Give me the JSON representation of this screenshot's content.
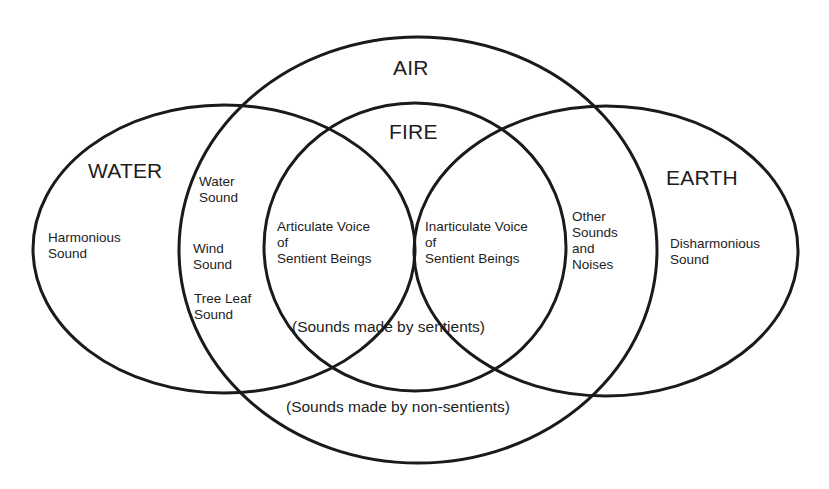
{
  "diagram": {
    "type": "venn",
    "sets": {
      "water": {
        "title": "WATER",
        "region_label": "Harmonious\nSound"
      },
      "air": {
        "title": "AIR"
      },
      "fire": {
        "title": "FIRE"
      },
      "earth": {
        "title": "EARTH",
        "region_label": "Disharmonious\nSound"
      }
    },
    "water_air_overlap": {
      "items": [
        "Water\nSound",
        "Wind\nSound",
        "Tree Leaf\nSound"
      ]
    },
    "fire_left": {
      "label": "Articulate Voice\nof\nSentient Beings"
    },
    "fire_right": {
      "label": "Inarticulate Voice\nof\nSentient Beings"
    },
    "earth_air_overlap": {
      "label": "Other\nSounds\nand\nNoises"
    },
    "captions": {
      "sentients": "(Sounds made by sentients)",
      "non_sentients": "(Sounds made by non-sentients)"
    },
    "stroke_color": "#1a1a1a",
    "background": "#ffffff"
  }
}
